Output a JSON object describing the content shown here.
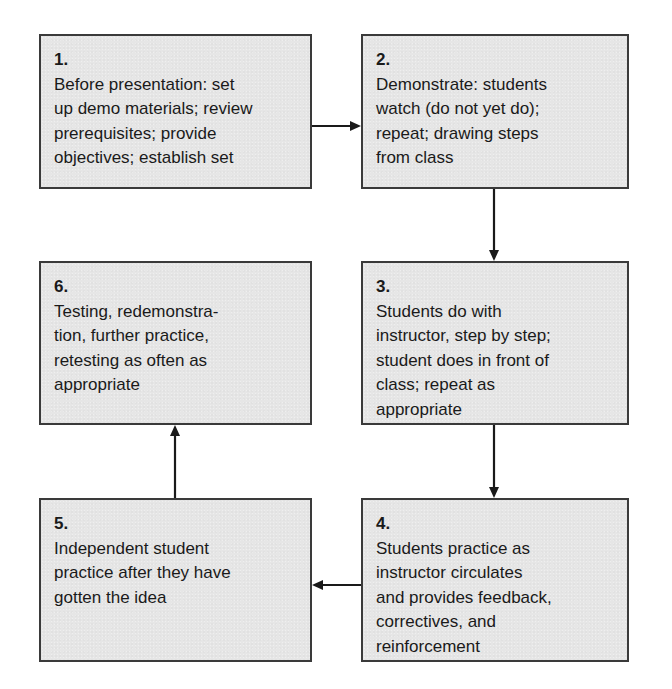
{
  "diagram": {
    "type": "flowchart",
    "colors": {
      "box_fill": "#e6e6e6",
      "box_border": "#3a3a3a",
      "arrow": "#1a1a1a",
      "background": "#ffffff"
    },
    "steps": [
      {
        "number": "1.",
        "text": "Before presentation: set\nup demo materials; review\nprerequisites; provide\nobjectives; establish set"
      },
      {
        "number": "2.",
        "text": "Demonstrate: students\nwatch (do not yet do);\nrepeat; drawing steps\nfrom class"
      },
      {
        "number": "3.",
        "text": "Students do with\ninstructor, step by step;\nstudent does in front of\nclass; repeat as\nappropriate"
      },
      {
        "number": "4.",
        "text": "Students practice as\ninstructor circulates\nand provides feedback,\ncorrectives, and\nreinforcement"
      },
      {
        "number": "5.",
        "text": "Independent student\npractice after they have\ngotten the idea"
      },
      {
        "number": "6.",
        "text": "Testing, redemonstra-\ntion, further practice,\nretesting as often as\nappropriate"
      }
    ],
    "connections": [
      {
        "from": "1",
        "to": "2",
        "direction": "right"
      },
      {
        "from": "2",
        "to": "3",
        "direction": "down"
      },
      {
        "from": "3",
        "to": "4",
        "direction": "down"
      },
      {
        "from": "4",
        "to": "5",
        "direction": "left"
      },
      {
        "from": "5",
        "to": "6",
        "direction": "up"
      }
    ]
  }
}
